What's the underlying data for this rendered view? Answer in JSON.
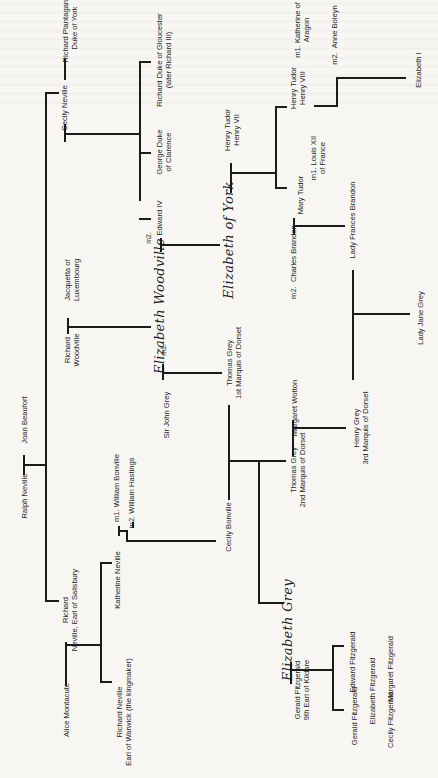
{
  "people": {
    "ralph_neville": "Ralph Neville",
    "joan_beaufort": "Joan Beaufort",
    "cecily_neville": "Cecily Neville",
    "richard_plantagenet": "Richard Plantaganet\nDuke of York",
    "richard_gloucester": "Richard Duke of Gloucester\n(later Richard III)",
    "george_clarence": "George Duke\nof Clarence",
    "edward_iv": "Edward IV",
    "jacquetta": "Jacquetta of\nLuxembourg",
    "richard_woodville": "Richard\nWoodville",
    "elizabeth_woodville": "Elizabeth Woodville",
    "m2_edward": "m2.",
    "m1_grey": "m1.",
    "sir_john_grey": "Sir John Grey",
    "thomas_grey_1": "Thomas Grey\n1st Marquis of Dorset",
    "elizabeth_of_york": "Elizabeth of York",
    "henry_vii": "Henry Tudor\nHenry VII",
    "henry_viii": "Henry Tudor\nHenry VIII",
    "katherine": "m1. Katherine of\nAragon",
    "anne_boleyn": "m2.  Anne Boleyn",
    "elizabeth_i": "Elizabeth I",
    "mary_tudor": "Mary Tudor",
    "louis_xii": "m1. Louis XII\nof France",
    "charles_brandon": "m2.  Charles Brandon",
    "frances_brandon": "Lady Frances Brandon",
    "lady_jane_grey": "Lady Jane Grey",
    "margaret_wotton": "Margaret Wotton",
    "henry_grey": "Henry Grey\n3rd Marquis of Dorset",
    "thomas_grey_2": "Thomas Grey\n2nd Marquis of Dorset",
    "cecily_bonville": "Cecily Bonville",
    "william_bonville": "m1. William Bonville",
    "william_hastings": "m2. William Hastings",
    "katherine_neville": "Katherine Neville",
    "richard_salisbury": "Richard\nNeville, Earl of Salisbury",
    "alice_montacute": "Alice Montacute",
    "richard_warwick": "Richard Neville\nEarl of Warwick (the kingmaker)",
    "elizabeth_grey": "Elizabeth Grey",
    "gerald_9th": "Gerald Fitzgerald\n9th Earl of Kildare",
    "gerald_fitz": "Gerald Fitzgerald",
    "edward_fitz": "Edward Fitzgerald",
    "elizabeth_fitz": "Elizabeth Fitzgerald",
    "cecily_fitz": "Cecily Fitzgerald",
    "margaret_fitz": "Margaret Fitzgerald"
  },
  "colors": {
    "line": "#1b1b1b",
    "paper": "#f7f6f3",
    "text": "#1e1e1e"
  }
}
